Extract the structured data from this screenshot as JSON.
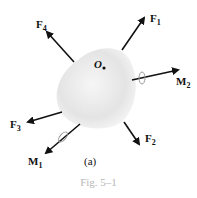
{
  "figure": {
    "caption": "Fig. 5–1",
    "panel_label": "(a)",
    "point_label": "O",
    "forces": [
      {
        "name": "F",
        "sub": "1"
      },
      {
        "name": "F",
        "sub": "2"
      },
      {
        "name": "F",
        "sub": "3"
      },
      {
        "name": "F",
        "sub": "4"
      }
    ],
    "moments": [
      {
        "name": "M",
        "sub": "1"
      },
      {
        "name": "M",
        "sub": "2"
      }
    ],
    "colors": {
      "body": "#e6e6e6",
      "arrow": "#111111",
      "caption": "#b8b8b8"
    }
  }
}
